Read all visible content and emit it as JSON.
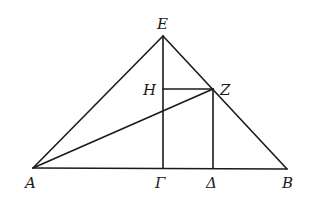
{
  "diagram": {
    "type": "geometric-figure",
    "points": {
      "E": {
        "label": "E"
      },
      "A": {
        "label": "A"
      },
      "B": {
        "label": "B"
      },
      "Gamma": {
        "label": "Γ"
      },
      "Delta": {
        "label": "Δ"
      },
      "H": {
        "label": "H"
      },
      "Z": {
        "label": "Z"
      }
    },
    "segments": [
      [
        "A",
        "E"
      ],
      [
        "E",
        "B"
      ],
      [
        "A",
        "B"
      ],
      [
        "E",
        "Gamma"
      ],
      [
        "H",
        "Z"
      ],
      [
        "Z",
        "Delta"
      ],
      [
        "A",
        "Z"
      ]
    ]
  }
}
